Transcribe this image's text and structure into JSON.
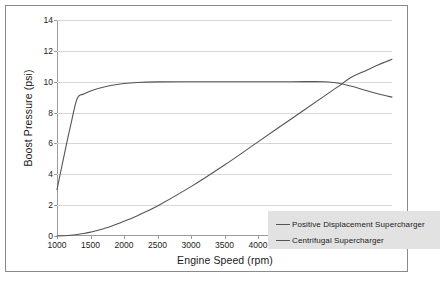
{
  "chart_data": {
    "type": "line",
    "title": "",
    "xlabel": "Engine Speed (rpm)",
    "ylabel": "Boost Pressure (psi)",
    "xlim": [
      1000,
      6000
    ],
    "ylim": [
      0,
      14
    ],
    "xticks": [
      1000,
      1500,
      2000,
      2500,
      3000,
      3500,
      4000,
      4500,
      5000,
      5500,
      6000
    ],
    "yticks": [
      0,
      2,
      4,
      6,
      8,
      10,
      12,
      14
    ],
    "grid": "horizontal",
    "legend_position": "inside-lower-right",
    "x": [
      1000,
      1100,
      1200,
      1300,
      1400,
      1500,
      1600,
      1800,
      2000,
      2200,
      2500,
      3000,
      3500,
      4000,
      4500,
      5000,
      5200,
      5400,
      5600,
      5800,
      6000
    ],
    "series": [
      {
        "name": "Positive Displacement Supercharger",
        "color": "#555555",
        "values": [
          3.0,
          5.1,
          7.1,
          8.9,
          9.2,
          9.4,
          9.55,
          9.75,
          9.88,
          9.95,
          9.99,
          10.0,
          10.0,
          10.0,
          10.0,
          10.0,
          9.9,
          9.7,
          9.45,
          9.2,
          9.0
        ]
      },
      {
        "name": "Centrifugal Supercharger",
        "color": "#555555",
        "values": [
          0.0,
          0.02,
          0.05,
          0.1,
          0.16,
          0.25,
          0.36,
          0.62,
          0.95,
          1.32,
          1.95,
          3.2,
          4.6,
          6.1,
          7.6,
          9.1,
          9.7,
          10.3,
          10.7,
          11.1,
          11.45
        ]
      }
    ]
  },
  "legend": {
    "entries": [
      {
        "label": "Positive Displacement Supercharger"
      },
      {
        "label": "Centrifugal Supercharger"
      }
    ]
  }
}
